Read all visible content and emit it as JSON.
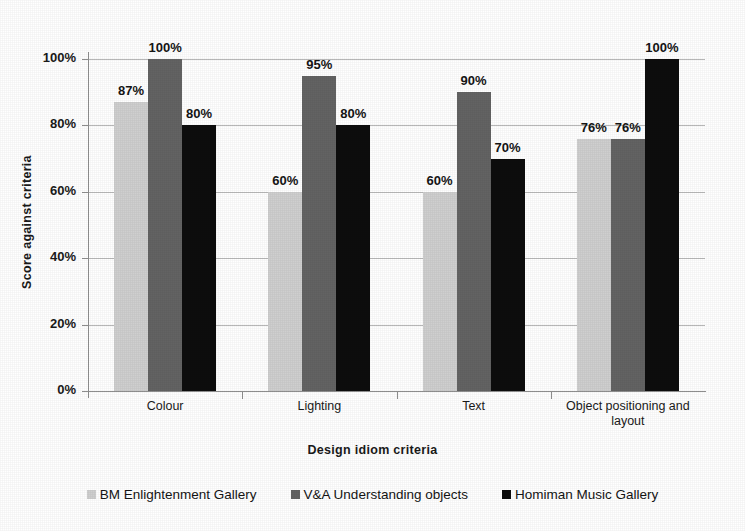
{
  "chart_data": {
    "type": "bar",
    "title": "",
    "xlabel": "Design idiom criteria",
    "ylabel": "Score against criteria",
    "categories": [
      "Colour",
      "Lighting",
      "Text",
      "Object positioning and layout"
    ],
    "series": [
      {
        "name": "BM Enlightenment Gallery",
        "color": "#cfcfcf",
        "values": [
          87,
          60,
          60,
          76
        ],
        "labels": [
          "87%",
          "60%",
          "60%",
          "76%"
        ]
      },
      {
        "name": "V&A Understanding objects",
        "color": "#636363",
        "values": [
          100,
          95,
          90,
          76
        ],
        "labels": [
          "100%",
          "95%",
          "90%",
          "76%"
        ]
      },
      {
        "name": "Homiman Music Gallery",
        "color": "#0d0d0d",
        "values": [
          80,
          80,
          70,
          100
        ],
        "labels": [
          "80%",
          "80%",
          "70%",
          "100%"
        ]
      }
    ],
    "ylim": [
      0,
      100
    ],
    "yticks": [
      0,
      20,
      40,
      60,
      80,
      100
    ],
    "ytick_labels": [
      "0%",
      "20%",
      "40%",
      "60%",
      "80%",
      "100%"
    ],
    "grid": true,
    "legend_position": "bottom",
    "data_labels": true
  },
  "legend": {
    "items": [
      {
        "label": "BM Enlightenment Gallery",
        "color": "#cfcfcf"
      },
      {
        "label": "V&A Understanding objects",
        "color": "#636363"
      },
      {
        "label": "Homiman Music Gallery",
        "color": "#0d0d0d"
      }
    ]
  },
  "axes": {
    "y_title": "Score against criteria",
    "x_title": "Design idiom criteria"
  }
}
